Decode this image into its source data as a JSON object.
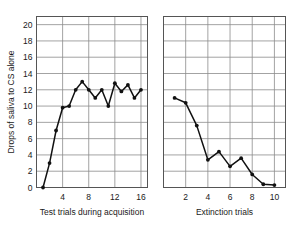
{
  "chart_data": [
    {
      "type": "line",
      "panel": "acquisition",
      "title": "",
      "xlabel": "Test trials during acquisition",
      "ylabel": "Drops of saliva to CS alone",
      "xlim": [
        0,
        17
      ],
      "ylim": [
        0,
        21
      ],
      "xticks": [
        4,
        8,
        12,
        16
      ],
      "xticklabels": [
        "4",
        "8",
        "12",
        "16"
      ],
      "yticks": [
        0,
        2,
        4,
        6,
        8,
        10,
        12,
        14,
        16,
        18,
        20
      ],
      "yticklabels": [
        "0",
        "2",
        "4",
        "6",
        "8",
        "10",
        "12",
        "14",
        "16",
        "18",
        "20"
      ],
      "grid": true,
      "marker": "filled-circle",
      "x": [
        1,
        2,
        3,
        4,
        5,
        6,
        7,
        8,
        9,
        10,
        11,
        12,
        13,
        14,
        15,
        16
      ],
      "values": [
        0,
        3,
        7,
        9.8,
        10,
        12,
        13,
        12,
        11,
        12,
        10,
        12.8,
        11.8,
        12.6,
        11,
        12
      ]
    },
    {
      "type": "line",
      "panel": "extinction",
      "title": "",
      "xlabel": "Extinction trials",
      "ylabel": "",
      "xlim": [
        0,
        11
      ],
      "ylim": [
        0,
        21
      ],
      "xticks": [
        2,
        4,
        6,
        8,
        10
      ],
      "xticklabels": [
        "2",
        "4",
        "6",
        "8",
        "10"
      ],
      "yticks": [
        0,
        2,
        4,
        6,
        8,
        10,
        12,
        14,
        16,
        18,
        20
      ],
      "grid": true,
      "marker": "filled-circle",
      "x": [
        1,
        2,
        3,
        4,
        5,
        6,
        7,
        8,
        9,
        10
      ],
      "values": [
        11,
        10.4,
        7.6,
        3.4,
        4.4,
        2.6,
        3.6,
        1.6,
        0.4,
        0.3
      ]
    }
  ],
  "figure": {
    "y_axis_title": "Drops of saliva to CS alone",
    "left_panel": {
      "x_axis_title": "Test trials during acquisition",
      "x_tick_labels": [
        "4",
        "8",
        "12",
        "16"
      ],
      "y_tick_labels": [
        "0",
        "2",
        "4",
        "6",
        "8",
        "10",
        "12",
        "14",
        "16",
        "18",
        "20"
      ]
    },
    "right_panel": {
      "x_axis_title": "Extinction trials",
      "x_tick_labels": [
        "2",
        "4",
        "6",
        "8",
        "10"
      ]
    },
    "colors": {
      "line": "#111111",
      "marker": "#111111",
      "grid": "#8c8c8c",
      "frame": "#555555",
      "background": "#ffffff",
      "text": "#1a1a1a"
    }
  }
}
